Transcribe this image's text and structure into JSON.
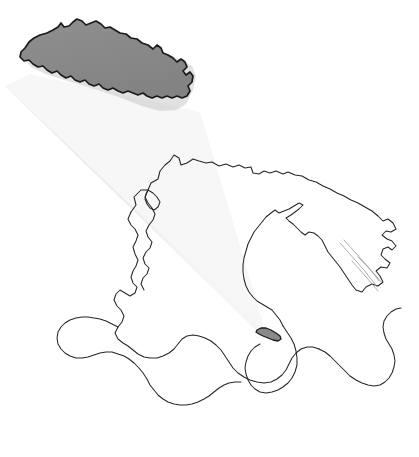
{
  "figure": {
    "type": "locator-map",
    "title": "Nepal locator map with magnified inset",
    "description": "Outline map of South Asia and the Middle East with Nepal shaded and magnified in the upper left, joined to its true position by a tapering highlight cone.",
    "width": 419,
    "height": 457,
    "background_color": "#ffffff"
  },
  "colors": {
    "background": "#ffffff",
    "coastline_stroke": "#262626",
    "highlight_fill": "#8a8a8a",
    "highlight_stroke": "#1a1a1a",
    "cone_fill": "#ededed",
    "cone_fill_light": "#f7f7f7",
    "river_stroke": "#9a9a9a",
    "inset_shadow": "#c9c9c9"
  },
  "inset": {
    "label": "Nepal",
    "role": "magnified-country-shape",
    "fill": "#8a8a8a",
    "stroke": "#1a1a1a",
    "position": {
      "x": 22,
      "y": 16,
      "width": 172,
      "height": 100
    }
  },
  "actual_location": {
    "label": "Nepal",
    "role": "country-at-map-scale",
    "fill": "#8a8a8a",
    "stroke": "#1a1a1a",
    "position": {
      "x": 256,
      "y": 327,
      "width": 26,
      "height": 14
    }
  },
  "zoom_cone": {
    "role": "magnification-indicator",
    "fill": "#ededed",
    "apex": {
      "x": 266,
      "y": 333
    },
    "base_left": {
      "x": 6,
      "y": 88
    },
    "base_right": {
      "x": 196,
      "y": 118
    }
  },
  "basemap": {
    "region": "South Asia and the Middle East",
    "features": [
      {
        "name": "arabian-peninsula",
        "type": "landmass-outline"
      },
      {
        "name": "iran-plateau",
        "type": "landmass-outline"
      },
      {
        "name": "central-asia-coast",
        "type": "landmass-outline"
      },
      {
        "name": "indian-subcontinent",
        "type": "landmass-outline"
      },
      {
        "name": "bay-of-bengal-coast",
        "type": "landmass-outline"
      },
      {
        "name": "river-network",
        "type": "hydrography"
      }
    ],
    "stroke": "#262626",
    "fill": "none"
  }
}
